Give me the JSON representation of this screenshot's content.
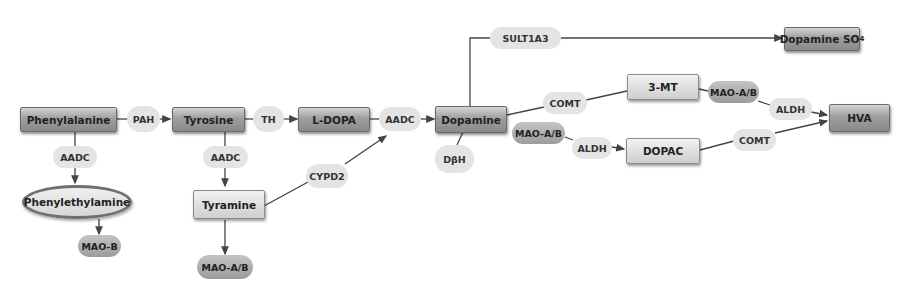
{
  "diagram": {
    "type": "metabolic-pathway",
    "colors": {
      "line": "#444444",
      "box_dark": "#9e9e9e",
      "box_light": "#dcdcdc",
      "pill_light": "#e4e4e4",
      "pill_dark": "#a8a8a8",
      "ellipse_border": "#6f6f6f"
    },
    "metabolites": {
      "phenylalanine": "Phenylalanine",
      "tyrosine": "Tyrosine",
      "l_dopa": "L-DOPA",
      "dopamine": "Dopamine",
      "dopamine_so4": "Dopamine SO",
      "dopamine_so4_sub": "4",
      "phenylethylamine": "Phenylethylamine",
      "tyramine": "Tyramine",
      "three_mt": "3-MT",
      "dopac": "DOPAC",
      "hva": "HVA"
    },
    "enzymes": {
      "pah": "PAH",
      "th": "TH",
      "aadc_phe": "AADC",
      "aadc_tyr": "AADC",
      "aadc_ldopa": "AADC",
      "cypd2": "CYPD2",
      "dbh": "DβH",
      "sult1a3": "SULT1A3",
      "comt_top": "COMT",
      "mao_ab_top": "MAO-A/B",
      "aldh_top": "ALDH",
      "mao_ab_mid": "MAO-A/B",
      "aldh_mid": "ALDH",
      "comt_bottom": "COMT",
      "mao_b": "MAO-B",
      "mao_ab_tyramine": "MAO-A/B"
    },
    "edges": [
      {
        "from": "Phenylalanine",
        "to": "Tyrosine",
        "enzyme": "PAH"
      },
      {
        "from": "Tyrosine",
        "to": "L-DOPA",
        "enzyme": "TH"
      },
      {
        "from": "L-DOPA",
        "to": "Dopamine",
        "enzyme": "AADC"
      },
      {
        "from": "Phenylalanine",
        "to": "Phenylethylamine",
        "enzyme": "AADC"
      },
      {
        "from": "Phenylethylamine",
        "to": "MAO-B",
        "enzyme": ""
      },
      {
        "from": "Tyrosine",
        "to": "Tyramine",
        "enzyme": "AADC"
      },
      {
        "from": "Tyramine",
        "to": "MAO-A/B",
        "enzyme": ""
      },
      {
        "from": "Tyramine",
        "to": "Dopamine",
        "enzyme": "CYPD2"
      },
      {
        "from": "Dopamine",
        "to": "Dopamine SO4",
        "enzyme": "SULT1A3"
      },
      {
        "from": "Dopamine",
        "to": "3-MT",
        "enzyme": "COMT"
      },
      {
        "from": "3-MT",
        "to": "HVA",
        "enzyme": "MAO-A/B, ALDH"
      },
      {
        "from": "Dopamine",
        "to": "DOPAC",
        "enzyme": "MAO-A/B, ALDH"
      },
      {
        "from": "DOPAC",
        "to": "HVA",
        "enzyme": "COMT"
      },
      {
        "from": "Dopamine",
        "to": "",
        "enzyme": "DβH"
      }
    ]
  }
}
